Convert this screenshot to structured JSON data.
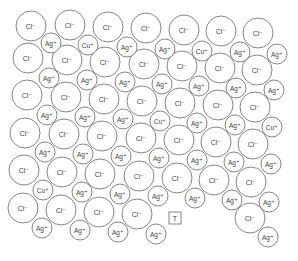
{
  "diagram": {
    "stroke": "#666666",
    "fill": "#ffffff",
    "text_color": "#444444",
    "labels": {
      "cl": "Cl⁻",
      "ag": "Ag⁺",
      "cu": "Cu⁺",
      "trap": "T"
    },
    "ions": [
      {
        "t": "cl",
        "x": 31,
        "y": 26,
        "r": 15
      },
      {
        "t": "cl",
        "x": 70,
        "y": 25,
        "r": 15
      },
      {
        "t": "cl",
        "x": 108,
        "y": 27,
        "r": 15
      },
      {
        "t": "cl",
        "x": 146,
        "y": 28,
        "r": 15
      },
      {
        "t": "cl",
        "x": 184,
        "y": 30,
        "r": 15
      },
      {
        "t": "cl",
        "x": 221,
        "y": 31,
        "r": 15
      },
      {
        "t": "cl",
        "x": 258,
        "y": 33,
        "r": 15
      },
      {
        "t": "ag",
        "x": 51,
        "y": 43,
        "r": 10
      },
      {
        "t": "cu",
        "x": 88,
        "y": 45,
        "r": 10
      },
      {
        "t": "ag",
        "x": 127,
        "y": 47,
        "r": 10
      },
      {
        "t": "ag",
        "x": 165,
        "y": 49,
        "r": 10
      },
      {
        "t": "cu",
        "x": 202,
        "y": 51,
        "r": 10
      },
      {
        "t": "ag",
        "x": 240,
        "y": 52,
        "r": 10
      },
      {
        "t": "ag",
        "x": 277,
        "y": 54,
        "r": 10
      },
      {
        "t": "cl",
        "x": 28,
        "y": 58,
        "r": 15
      },
      {
        "t": "cl",
        "x": 67,
        "y": 60,
        "r": 15
      },
      {
        "t": "cl",
        "x": 105,
        "y": 62,
        "r": 15
      },
      {
        "t": "cl",
        "x": 144,
        "y": 64,
        "r": 15
      },
      {
        "t": "cl",
        "x": 182,
        "y": 66,
        "r": 15
      },
      {
        "t": "cl",
        "x": 220,
        "y": 68,
        "r": 15
      },
      {
        "t": "cl",
        "x": 257,
        "y": 70,
        "r": 15
      },
      {
        "t": "ag",
        "x": 49,
        "y": 78,
        "r": 10
      },
      {
        "t": "ag",
        "x": 87,
        "y": 80,
        "r": 10
      },
      {
        "t": "ag",
        "x": 125,
        "y": 82,
        "r": 10
      },
      {
        "t": "ag",
        "x": 162,
        "y": 84,
        "r": 10
      },
      {
        "t": "ag",
        "x": 199,
        "y": 86,
        "r": 10
      },
      {
        "t": "ag",
        "x": 236,
        "y": 88,
        "r": 10
      },
      {
        "t": "ag",
        "x": 274,
        "y": 90,
        "r": 10
      },
      {
        "t": "cl",
        "x": 27,
        "y": 95,
        "r": 15
      },
      {
        "t": "cl",
        "x": 66,
        "y": 97,
        "r": 15
      },
      {
        "t": "cl",
        "x": 104,
        "y": 99,
        "r": 15
      },
      {
        "t": "cl",
        "x": 142,
        "y": 101,
        "r": 15
      },
      {
        "t": "cl",
        "x": 180,
        "y": 103,
        "r": 15
      },
      {
        "t": "cl",
        "x": 218,
        "y": 105,
        "r": 15
      },
      {
        "t": "cl",
        "x": 255,
        "y": 107,
        "r": 15
      },
      {
        "t": "ag",
        "x": 47,
        "y": 115,
        "r": 10
      },
      {
        "t": "ag",
        "x": 85,
        "y": 117,
        "r": 10
      },
      {
        "t": "ag",
        "x": 123,
        "y": 119,
        "r": 10
      },
      {
        "t": "cu",
        "x": 160,
        "y": 121,
        "r": 10
      },
      {
        "t": "ag",
        "x": 197,
        "y": 123,
        "r": 10
      },
      {
        "t": "ag",
        "x": 235,
        "y": 125,
        "r": 10
      },
      {
        "t": "cu",
        "x": 272,
        "y": 127,
        "r": 10
      },
      {
        "t": "cl",
        "x": 25,
        "y": 133,
        "r": 15
      },
      {
        "t": "cl",
        "x": 64,
        "y": 134,
        "r": 15
      },
      {
        "t": "cl",
        "x": 102,
        "y": 136,
        "r": 15
      },
      {
        "t": "cl",
        "x": 141,
        "y": 138,
        "r": 15
      },
      {
        "t": "cl",
        "x": 179,
        "y": 140,
        "r": 15
      },
      {
        "t": "cl",
        "x": 216,
        "y": 142,
        "r": 15
      },
      {
        "t": "cl",
        "x": 253,
        "y": 144,
        "r": 15
      },
      {
        "t": "ag",
        "x": 45,
        "y": 152,
        "r": 10
      },
      {
        "t": "ag",
        "x": 83,
        "y": 154,
        "r": 10
      },
      {
        "t": "ag",
        "x": 121,
        "y": 156,
        "r": 10
      },
      {
        "t": "ag",
        "x": 159,
        "y": 158,
        "r": 10
      },
      {
        "t": "ag",
        "x": 197,
        "y": 160,
        "r": 10
      },
      {
        "t": "ag",
        "x": 234,
        "y": 162,
        "r": 10
      },
      {
        "t": "ag",
        "x": 271,
        "y": 164,
        "r": 10
      },
      {
        "t": "cl",
        "x": 24,
        "y": 170,
        "r": 15
      },
      {
        "t": "cl",
        "x": 62,
        "y": 172,
        "r": 15
      },
      {
        "t": "cl",
        "x": 100,
        "y": 174,
        "r": 15
      },
      {
        "t": "cl",
        "x": 139,
        "y": 176,
        "r": 15
      },
      {
        "t": "cl",
        "x": 177,
        "y": 178,
        "r": 15
      },
      {
        "t": "cl",
        "x": 214,
        "y": 180,
        "r": 15
      },
      {
        "t": "cl",
        "x": 251,
        "y": 182,
        "r": 15
      },
      {
        "t": "cu",
        "x": 43,
        "y": 190,
        "r": 10
      },
      {
        "t": "ag",
        "x": 82,
        "y": 192,
        "r": 10
      },
      {
        "t": "ag",
        "x": 120,
        "y": 194,
        "r": 10
      },
      {
        "t": "ag",
        "x": 158,
        "y": 196,
        "r": 10
      },
      {
        "t": "ag",
        "x": 195,
        "y": 198,
        "r": 10
      },
      {
        "t": "ag",
        "x": 232,
        "y": 200,
        "r": 10
      },
      {
        "t": "ag",
        "x": 269,
        "y": 202,
        "r": 10
      },
      {
        "t": "cl",
        "x": 23,
        "y": 208,
        "r": 15
      },
      {
        "t": "cl",
        "x": 61,
        "y": 210,
        "r": 15
      },
      {
        "t": "cl",
        "x": 99,
        "y": 212,
        "r": 15
      },
      {
        "t": "cl",
        "x": 137,
        "y": 214,
        "r": 15
      },
      {
        "t": "cl",
        "x": 250,
        "y": 218,
        "r": 15
      },
      {
        "t": "ag",
        "x": 42,
        "y": 228,
        "r": 10
      },
      {
        "t": "ag",
        "x": 80,
        "y": 230,
        "r": 10
      },
      {
        "t": "ag",
        "x": 118,
        "y": 232,
        "r": 10
      },
      {
        "t": "ag",
        "x": 156,
        "y": 234,
        "r": 10
      },
      {
        "t": "ag",
        "x": 268,
        "y": 237,
        "r": 10
      }
    ],
    "trap": {
      "x": 175,
      "y": 218,
      "size": 12
    }
  }
}
